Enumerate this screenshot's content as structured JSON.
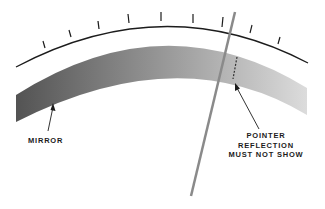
{
  "diagram": {
    "type": "meter scale with anti-parallax mirror",
    "labels": {
      "mirror": "MIRROR",
      "pointer_reflection": [
        "POINTER",
        "REFLECTION",
        "MUST NOT SHOW"
      ]
    },
    "scale": {
      "tick_count": 9
    },
    "colors": {
      "ink": "#1c1c1c",
      "mirror_dark": "#555555",
      "mirror_light": "#d4d4d4",
      "pointer": "#888888",
      "background": "#ffffff"
    }
  }
}
